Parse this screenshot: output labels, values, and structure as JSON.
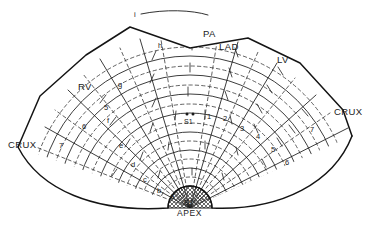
{
  "figure": {
    "type": "anatomical-diagram",
    "background_color": "#ffffff",
    "ink_color": "#1a1a1a"
  },
  "anatomical_labels": [
    {
      "id": "pa",
      "text": "PA",
      "x": 203,
      "y": 37
    },
    {
      "id": "lad",
      "text": "LAD",
      "x": 219,
      "y": 50
    },
    {
      "id": "lv",
      "text": "LV",
      "x": 277,
      "y": 63
    },
    {
      "id": "rv",
      "text": "RV",
      "x": 78,
      "y": 90
    },
    {
      "id": "crux-left",
      "text": "CRUX",
      "x": 8,
      "y": 148
    },
    {
      "id": "crux-right",
      "text": "CRUX",
      "x": 334,
      "y": 115
    },
    {
      "id": "apex",
      "text": "APEX",
      "x": 177,
      "y": 216
    }
  ],
  "septal_markers": [
    {
      "id": "s1",
      "text": "S1",
      "x": 190,
      "y": 124,
      "dots": 2
    },
    {
      "id": "s2",
      "text": "S2",
      "x": 190,
      "y": 205,
      "dots": 0
    }
  ],
  "letter_segments": {
    "note": "left-hand letter series, outer to inner",
    "items": [
      {
        "label": "i",
        "x": 134,
        "y": 17
      },
      {
        "label": "h",
        "x": 158,
        "y": 48
      },
      {
        "label": "g",
        "x": 118,
        "y": 87
      },
      {
        "label": "f",
        "x": 107,
        "y": 123
      },
      {
        "label": "e",
        "x": 119,
        "y": 148
      },
      {
        "label": "d",
        "x": 131,
        "y": 167
      },
      {
        "label": "c",
        "x": 143,
        "y": 182
      },
      {
        "label": "b",
        "x": 157,
        "y": 193
      },
      {
        "label": "a",
        "x": 170,
        "y": 199
      }
    ]
  },
  "numbered_segments": {
    "note": "right-hand number series plus left-hand mirrored numbers",
    "left_items": [
      {
        "label": "5",
        "x": 104,
        "y": 110
      },
      {
        "label": "6",
        "x": 82,
        "y": 129
      },
      {
        "label": "7",
        "x": 59,
        "y": 148
      }
    ],
    "right_items": [
      {
        "label": "1",
        "x": 207,
        "y": 119
      },
      {
        "label": "2",
        "x": 223,
        "y": 121
      },
      {
        "label": "3",
        "x": 240,
        "y": 131
      },
      {
        "label": "4",
        "x": 256,
        "y": 139
      },
      {
        "label": "5",
        "x": 271,
        "y": 152
      },
      {
        "label": "6",
        "x": 285,
        "y": 165
      },
      {
        "label": "7",
        "x": 310,
        "y": 132
      }
    ]
  },
  "geometry": {
    "fan_center_x": 190,
    "fan_center_y": 208,
    "arc_radii": [
      22,
      40,
      58,
      76,
      95,
      114,
      133,
      152,
      171
    ],
    "dashed_arc_radii": [
      31,
      49,
      67,
      85,
      104,
      123,
      142,
      161
    ],
    "apex_dome_radius": 22,
    "apex_dome_fill": "crosshatch"
  }
}
